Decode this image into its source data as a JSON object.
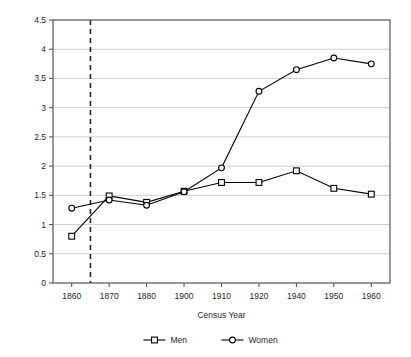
{
  "chart_data": {
    "type": "line",
    "title": "",
    "xlabel": "Census Year",
    "ylabel": "Ratio of Blacks to Whites",
    "categories": [
      "1860",
      "1870",
      "1880",
      "1900",
      "1910",
      "1920",
      "1940",
      "1950",
      "1960"
    ],
    "ylim": [
      0,
      4.5
    ],
    "ytick_labels": [
      "0",
      "0.5",
      "1",
      "1.5",
      "2",
      "2.5",
      "3",
      "3.5",
      "4",
      "4.5"
    ],
    "ytick_values": [
      0,
      0.5,
      1,
      1.5,
      2,
      2.5,
      3,
      3.5,
      4,
      4.5
    ],
    "grid": "horizontal",
    "legend_position": "bottom",
    "series": [
      {
        "name": "Men",
        "marker": "open-square",
        "color": "#000000",
        "values": [
          0.8,
          1.49,
          1.38,
          1.57,
          1.72,
          1.72,
          1.92,
          1.62,
          1.52
        ]
      },
      {
        "name": "Women",
        "marker": "open-circle",
        "color": "#000000",
        "values": [
          1.28,
          1.42,
          1.33,
          1.56,
          1.97,
          3.28,
          3.65,
          3.85,
          3.75
        ]
      }
    ],
    "annotations": [
      {
        "name": "emancipation-reference-line",
        "type": "vertical-dashed-line",
        "x_position": "1865",
        "label": ""
      }
    ]
  },
  "legend": {
    "items": [
      {
        "label": "Men",
        "marker": "open-square"
      },
      {
        "label": "Women",
        "marker": "open-circle"
      }
    ]
  },
  "colors": {
    "line": "#000000",
    "grid": "#c9c9c9",
    "axis": "#4a4a4a",
    "background": "#ffffff",
    "text": "#1f1f1f"
  }
}
